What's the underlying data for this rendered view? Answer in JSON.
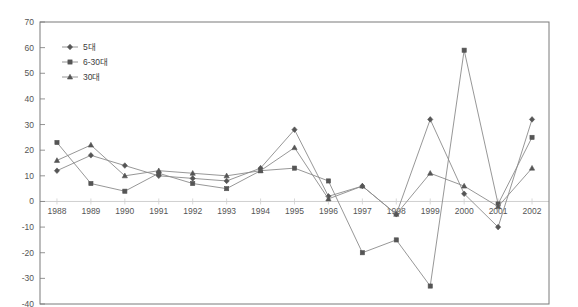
{
  "chart_data": {
    "type": "line",
    "title": "",
    "xlabel": "",
    "ylabel": "",
    "categories": [
      "1988",
      "1989",
      "1990",
      "1991",
      "1992",
      "1993",
      "1994",
      "1995",
      "1996",
      "1997",
      "1998",
      "1999",
      "2000",
      "2001",
      "2002"
    ],
    "series": [
      {
        "name": "5대",
        "marker": "diamond",
        "values": [
          12,
          18,
          14,
          10,
          9,
          8,
          13,
          28,
          2,
          6,
          -5,
          32,
          3,
          -10,
          32
        ]
      },
      {
        "name": "6-30대",
        "marker": "square",
        "values": [
          23,
          7,
          4,
          11,
          7,
          5,
          12,
          13,
          8,
          -20,
          -15,
          -33,
          59,
          -1,
          25
        ]
      },
      {
        "name": "30대",
        "marker": "triangle",
        "values": [
          16,
          22,
          10,
          12,
          11,
          10,
          12,
          21,
          1,
          6,
          -5,
          11,
          6,
          -2,
          13
        ]
      }
    ],
    "ylim": [
      -40,
      70
    ],
    "ytick_step": 10,
    "yticks": [
      "70",
      "60",
      "50",
      "40",
      "30",
      "20",
      "10",
      "0",
      "-10",
      "-20",
      "-30",
      "-40"
    ],
    "grid": false,
    "zero_line": true,
    "legend_position": "top-left"
  },
  "colors": {
    "axis": "#7a7a7a",
    "line": "#8b8b8b",
    "marker": "#555555",
    "text": "#555555",
    "zero_line": "#cfcfcf",
    "background": "#ffffff"
  }
}
